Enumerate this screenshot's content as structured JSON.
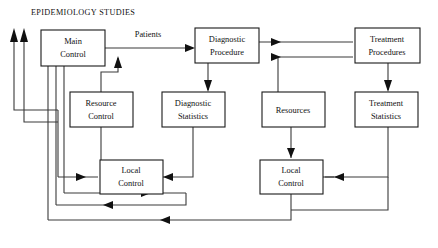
{
  "diagram": {
    "title": "EPIDEMIOLOGY STUDIES",
    "type": "block-flow-diagram",
    "canvas": {
      "width": 438,
      "height": 248,
      "background": "#ffffff"
    },
    "colors": {
      "box_stroke": "#1a1a1a",
      "box_fill": "#ffffff",
      "line": "#3a3a3a",
      "arrow": "#111111",
      "text": "#111111"
    },
    "nodes": [
      {
        "id": "main-control",
        "label_line1": "Main",
        "label_line2": "Control",
        "x": 41,
        "y": 30,
        "w": 64,
        "h": 36
      },
      {
        "id": "diagnostic-procedure",
        "label_line1": "Diagnostic",
        "label_line2": "Procedure",
        "x": 195,
        "y": 28,
        "w": 64,
        "h": 35
      },
      {
        "id": "treatment-procedures",
        "label_line1": "Treatment",
        "label_line2": "Procedures",
        "x": 355,
        "y": 28,
        "w": 65,
        "h": 35
      },
      {
        "id": "resource-control",
        "label_line1": "Resource",
        "label_line2": "Control",
        "x": 70,
        "y": 92,
        "w": 63,
        "h": 35
      },
      {
        "id": "diagnostic-statistics",
        "label_line1": "Diagnostic",
        "label_line2": "Statistics",
        "x": 162,
        "y": 92,
        "w": 63,
        "h": 35
      },
      {
        "id": "resources",
        "label_line1": "Resources",
        "label_line2": "",
        "x": 262,
        "y": 92,
        "w": 63,
        "h": 35
      },
      {
        "id": "treatment-statistics",
        "label_line1": "Treatment",
        "label_line2": "Statistics",
        "x": 355,
        "y": 92,
        "w": 63,
        "h": 35
      },
      {
        "id": "local-control-left",
        "label_line1": "Local",
        "label_line2": "Control",
        "x": 100,
        "y": 160,
        "w": 63,
        "h": 34
      },
      {
        "id": "local-control-right",
        "label_line1": "Local",
        "label_line2": "Control",
        "x": 260,
        "y": 160,
        "w": 63,
        "h": 34
      }
    ],
    "edge_labels": [
      {
        "id": "patients",
        "text": "Patients",
        "x": 148,
        "y": 35
      }
    ],
    "connections": [
      {
        "from": "main-control",
        "to": "diagnostic-procedure",
        "label": "Patients"
      },
      {
        "from": "diagnostic-procedure",
        "to": "treatment-procedures",
        "label": ""
      },
      {
        "from": "diagnostic-procedure",
        "to": "diagnostic-statistics",
        "label": ""
      },
      {
        "from": "treatment-procedures",
        "to": "treatment-statistics",
        "label": ""
      },
      {
        "from": "resource-control",
        "to": "main-control",
        "label": ""
      },
      {
        "from": "resource-control",
        "to": "local-control-left",
        "label": ""
      },
      {
        "from": "diagnostic-statistics",
        "to": "local-control-left",
        "label": ""
      },
      {
        "from": "resources",
        "to": "treatment-procedures",
        "label": ""
      },
      {
        "from": "resources",
        "to": "local-control-right",
        "label": ""
      },
      {
        "from": "treatment-statistics",
        "to": "local-control-right",
        "label": ""
      },
      {
        "from": "local-control-left",
        "to": "main-control",
        "label": ""
      },
      {
        "from": "local-control-right",
        "to": "main-control",
        "label": ""
      },
      {
        "from": "local-control-left",
        "to": "local-control-right",
        "label": ""
      },
      {
        "from": "treatment-statistics",
        "to": "main-control",
        "label": ""
      }
    ]
  }
}
